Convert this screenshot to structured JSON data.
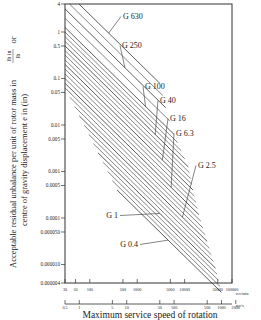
{
  "chart_data": {
    "type": "line",
    "title": "",
    "xlabel": "Maximum service speed of rotation",
    "ylabel_line1": "Acceptable residual unbalance per unit of rotor mass in lb in / lb or",
    "ylabel_line2": "centre of gravity displacement e in (in)",
    "ylabel_frac_num": "lb in",
    "ylabel_frac_den": "lb",
    "x_scale": "log",
    "y_scale": "log",
    "grid": false,
    "xlim_rev_min": [
      30,
      100000
    ],
    "ylim": [
      4e-06,
      4
    ],
    "x_primary": {
      "unit": "rev/min",
      "ticks": [
        30,
        50,
        100,
        500,
        1000,
        5000,
        10000,
        50000,
        100000
      ],
      "tick_labels": [
        "30",
        "50",
        "100",
        "500",
        "1000",
        "5000",
        "10000",
        "50000",
        "100000"
      ]
    },
    "x_secondary": {
      "unit": "rev/s",
      "ticks": [
        0.5,
        1,
        5,
        10,
        50,
        100,
        500,
        1000,
        2000
      ],
      "tick_labels": [
        "0.5",
        "1",
        "5",
        "10",
        "50",
        "100",
        "500",
        "1000",
        "2000"
      ]
    },
    "y_ticks": [
      4,
      1,
      0.5,
      0.1,
      0.05,
      0.01,
      0.005,
      0.001,
      0.0005,
      0.0001,
      5e-05,
      1e-05,
      4e-06
    ],
    "y_tick_labels": [
      "4",
      "1",
      "0.5",
      "0.1",
      "0.05",
      "0.01",
      "0.005",
      "0.001",
      "0.0005",
      "0.0001",
      "0.000050",
      "0.000010",
      "0.000004"
    ],
    "series": [
      {
        "name": "G 630",
        "grade": 630
      },
      {
        "name": "G 250",
        "grade": 250
      },
      {
        "name": "G 100",
        "grade": 100
      },
      {
        "name": "G 40",
        "grade": 40
      },
      {
        "name": "G 16",
        "grade": 16
      },
      {
        "name": "G 6.3",
        "grade": 6.3
      },
      {
        "name": "G 2.5",
        "grade": 2.5
      },
      {
        "name": "G 1",
        "grade": 1
      },
      {
        "name": "G 0.4",
        "grade": 0.4
      }
    ],
    "annotations": [
      "G 630",
      "G 250",
      "G 100",
      "G 40",
      "G 16",
      "G 6.3",
      "G 2.5",
      "G 1",
      "G 0.4"
    ]
  },
  "labels": {
    "x_title": "Maximum service speed of rotation",
    "x_unit_primary": "rev/min",
    "x_unit_secondary": "rev/s",
    "y_title_a": "Acceptable residual unbalance per unit of rotor mass in",
    "y_frac_num": "lb in",
    "y_frac_den": "lb",
    "y_title_or": "or",
    "y_title_b": "centre of gravity displacement e in (in)"
  }
}
